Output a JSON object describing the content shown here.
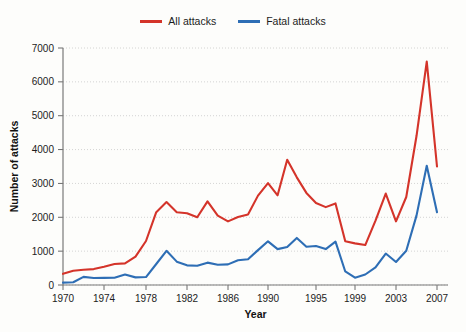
{
  "chart_data": {
    "type": "line",
    "title": "",
    "xlabel": "Year",
    "ylabel": "Number of attacks",
    "xlim": [
      1970,
      2007
    ],
    "ylim": [
      0,
      7000
    ],
    "grid": true,
    "legend_position": "top-center",
    "xticks": [
      1970,
      1974,
      1978,
      1982,
      1986,
      1990,
      1995,
      1999,
      2003,
      2007
    ],
    "xtick_labels": [
      "1970",
      "1974",
      "1978",
      "1982",
      "1986",
      "1990",
      "1995",
      "1999",
      "2003",
      "2007"
    ],
    "yticks": [
      0,
      1000,
      2000,
      3000,
      4000,
      5000,
      6000,
      7000
    ],
    "ytick_labels": [
      "0",
      "1000",
      "2000",
      "3000",
      "4000",
      "5000",
      "6000",
      "7000"
    ],
    "x": [
      1970,
      1971,
      1972,
      1973,
      1974,
      1975,
      1976,
      1977,
      1978,
      1979,
      1980,
      1981,
      1982,
      1983,
      1984,
      1985,
      1986,
      1987,
      1988,
      1989,
      1990,
      1991,
      1992,
      1993,
      1994,
      1995,
      1996,
      1997,
      1998,
      1999,
      2000,
      2001,
      2002,
      2003,
      2004,
      2005,
      2006,
      2007
    ],
    "series": [
      {
        "name": "All attacks",
        "color": "#d4342a",
        "values": [
          330,
          420,
          450,
          470,
          540,
          620,
          640,
          840,
          1300,
          2150,
          2450,
          2150,
          2120,
          2000,
          2470,
          2050,
          1880,
          2010,
          2080,
          2640,
          3010,
          2650,
          3700,
          3180,
          2720,
          2420,
          2300,
          2410,
          1290,
          1230,
          1180,
          1900,
          2700,
          1880,
          2600,
          4400,
          6600,
          3500
        ]
      },
      {
        "name": "Fatal attacks",
        "color": "#2e6eb5",
        "values": [
          70,
          80,
          240,
          205,
          210,
          215,
          310,
          225,
          235,
          620,
          1010,
          690,
          580,
          570,
          660,
          600,
          610,
          730,
          760,
          1030,
          1290,
          1060,
          1120,
          1390,
          1130,
          1150,
          1060,
          1280,
          400,
          215,
          310,
          520,
          930,
          680,
          1010,
          2050,
          3520,
          2150
        ]
      }
    ]
  },
  "legend": {
    "entries": [
      {
        "label": "All attacks",
        "color": "#d4342a"
      },
      {
        "label": "Fatal attacks",
        "color": "#2e6eb5"
      }
    ]
  },
  "axes": {
    "y_title": "Number of attacks",
    "x_title": "Year"
  }
}
